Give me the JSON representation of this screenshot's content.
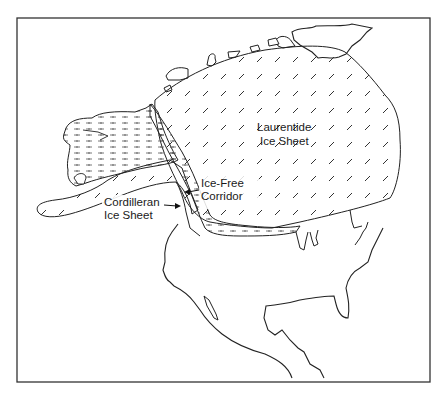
{
  "map": {
    "subject": "North America during the last glacial maximum",
    "frame_color": "#333333",
    "line_color": "#222222",
    "background": "#ffffff",
    "regions": [
      {
        "id": "laurentide",
        "label_line1": "Laurentide",
        "label_line2": "Ice Sheet",
        "pattern": "diagonal-dashes"
      },
      {
        "id": "cordilleran",
        "label_line1": "Cordilleran",
        "label_line2": "Ice Sheet",
        "pattern": "diagonal-dashes"
      },
      {
        "id": "ice-free-corridor",
        "label_line1": "Ice-Free",
        "label_line2": "Corridor",
        "pattern": "horizontal-dashes"
      },
      {
        "id": "beringia",
        "pattern": "horizontal-dashes"
      }
    ]
  }
}
